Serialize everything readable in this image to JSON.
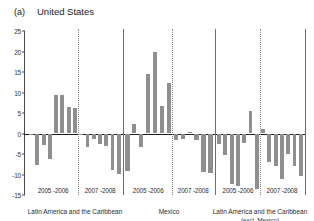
{
  "figure": {
    "panel_letter": "(a)",
    "title": "United States"
  },
  "chart_data": {
    "type": "bar",
    "title": "United States",
    "panel": "(a)",
    "xlabel": "",
    "ylabel": "",
    "ylim": [
      -15,
      25
    ],
    "yticks": [
      25,
      20,
      15,
      10,
      5,
      0,
      -5,
      -10,
      -15
    ],
    "ytick_labels": [
      "25",
      "20",
      "15",
      "10",
      "5",
      "0",
      "-5",
      "-10",
      "-15"
    ],
    "grid": false,
    "legend": "none",
    "bar_color": "#8f8f8f",
    "groups": [
      {
        "name": "Latin America and the Caribbean",
        "periods": [
          {
            "label": "2005 -2006",
            "values": [
              -0.4,
              -7.6,
              -2.8,
              -6.2,
              9.4,
              9.4,
              6.4,
              6.3
            ]
          },
          {
            "label": "2007 -2008",
            "values": [
              -0.3,
              -3.2,
              -1.3,
              -2.6,
              -3.0,
              -8.9,
              -9.8
            ]
          }
        ]
      },
      {
        "name": "Mexico",
        "periods": [
          {
            "label": "2005 -2006",
            "values": [
              -9.2,
              2.3,
              -3.4,
              14.4,
              19.8,
              6.8,
              12.2
            ]
          },
          {
            "label": "2007 -2008",
            "values": [
              -1.5,
              -1.4,
              0.3,
              -1.6,
              -9.3,
              -9.6
            ]
          }
        ]
      },
      {
        "name": "Latin America and the Caribbean",
        "name_sub": "(excl. Mexico)",
        "periods": [
          {
            "label": "2005 -2006",
            "values": [
              -2.6,
              -5.3,
              -12.3,
              -12.9,
              -2.2,
              5.6,
              -13.5
            ]
          },
          {
            "label": "2007 -2008",
            "values": [
              1.1,
              -7.0,
              -7.9,
              -11.0,
              -5.0,
              -7.9,
              -10.3
            ]
          }
        ]
      }
    ]
  }
}
